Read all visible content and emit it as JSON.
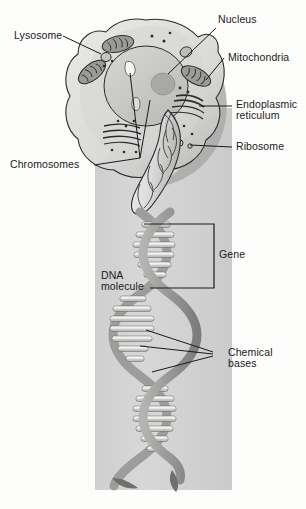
{
  "figure": {
    "background_color": "#fdfdfc",
    "panel_color": "#d2d2d2",
    "ink_color": "#1a1a1a"
  },
  "labels": {
    "lysosome": "Lysosome",
    "nucleus": "Nucleus",
    "mitochondria": "Mitochondria",
    "endoplasmic_reticulum_line1": "Endoplasmic",
    "endoplasmic_reticulum_line2": "reticulum",
    "ribosome": "Ribosome",
    "chromosomes": "Chromosomes",
    "gene": "Gene",
    "dna_molecule_line1": "DNA",
    "dna_molecule_line2": "molecule",
    "chemical_bases_line1": "Chemical",
    "chemical_bases_line2": "bases"
  },
  "structures": {
    "cell_membrane": "cell-membrane",
    "cytoplasm": "cytoplasm",
    "nucleus_body": "nucleus",
    "nucleolus": "nucleolus",
    "mitochondrion": "mitochondrion",
    "lysosome_body": "lysosome",
    "er_stack": "endoplasmic-reticulum",
    "ribosome_dot": "ribosome",
    "chromosome_body": "chromosome",
    "dna_helix": "dna-double-helix",
    "base_pair": "base-pair-rung",
    "gene_bracket": "gene-bracket"
  },
  "colors": {
    "cell_fill": "#dcdcda",
    "cell_shadow": "#a9a9a7",
    "nucleus_fill": "#c8c8c6",
    "nucleolus_fill": "#a8a8a6",
    "organelle_fill": "#9a9a98",
    "helix_back": "#9d9d9b",
    "helix_front": "#8d8d8b",
    "rung_light": "#f2f2f0",
    "rung_mid": "#c4c4c2",
    "outline": "#2b2b2b"
  }
}
